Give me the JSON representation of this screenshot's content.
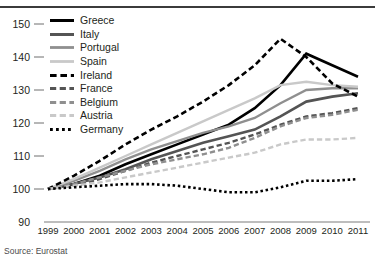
{
  "source_note": "Source: Eurostat",
  "axis": {
    "y_ticks": [
      "150",
      "140",
      "130",
      "120",
      "110",
      "100",
      "90"
    ],
    "x_ticks": [
      "1999",
      "2000",
      "2001",
      "2002",
      "2003",
      "2004",
      "2005",
      "2006",
      "2007",
      "2008",
      "2009",
      "2010",
      "2011"
    ]
  },
  "legend": {
    "items": [
      {
        "label": "Greece",
        "color": "#000000",
        "style": "solid",
        "width": 2.6
      },
      {
        "label": "Italy",
        "color": "#545454",
        "style": "solid",
        "width": 2.6
      },
      {
        "label": "Portugal",
        "color": "#8f8f8f",
        "style": "solid",
        "width": 2.4
      },
      {
        "label": "Spain",
        "color": "#c9c9c9",
        "style": "solid",
        "width": 2.4
      },
      {
        "label": "Ireland",
        "color": "#000000",
        "style": "dashed",
        "width": 2.6
      },
      {
        "label": "France",
        "color": "#545454",
        "style": "dashed",
        "width": 2.4
      },
      {
        "label": "Belgium",
        "color": "#8f8f8f",
        "style": "dashed",
        "width": 2.4
      },
      {
        "label": "Austria",
        "color": "#c9c9c9",
        "style": "dashed",
        "width": 2.4
      },
      {
        "label": "Germany",
        "color": "#000000",
        "style": "dotted",
        "width": 2.6
      }
    ]
  },
  "chart_data": {
    "type": "line",
    "title": "",
    "subtitle": "",
    "xlabel": "",
    "ylabel": "",
    "ylim": [
      90,
      150
    ],
    "xlim": [
      "1999",
      "2011"
    ],
    "grid": false,
    "legend_position": "top-left",
    "annotations": [
      "Source: Eurostat"
    ],
    "x": [
      1999,
      2000,
      2001,
      2002,
      2003,
      2004,
      2005,
      2006,
      2007,
      2008,
      2009,
      2010,
      2011
    ],
    "series": [
      {
        "name": "Greece",
        "color": "#000000",
        "style": "solid",
        "width": 2.6,
        "values": [
          100.0,
          101.5,
          104.0,
          107.5,
          110.5,
          113.5,
          116.5,
          119.5,
          124.5,
          131.5,
          141.0,
          137.5,
          134.0
        ]
      },
      {
        "name": "Italy",
        "color": "#545454",
        "style": "solid",
        "width": 2.6,
        "values": [
          100.0,
          101.5,
          103.5,
          106.0,
          109.0,
          111.5,
          114.0,
          116.0,
          118.0,
          122.0,
          126.5,
          128.0,
          129.0
        ]
      },
      {
        "name": "Portugal",
        "color": "#8f8f8f",
        "style": "solid",
        "width": 2.4,
        "values": [
          100.0,
          102.5,
          105.5,
          109.0,
          112.0,
          114.5,
          117.0,
          119.0,
          121.5,
          126.0,
          130.0,
          130.5,
          130.5
        ]
      },
      {
        "name": "Spain",
        "color": "#c9c9c9",
        "style": "solid",
        "width": 2.4,
        "values": [
          100.0,
          103.0,
          106.5,
          110.0,
          113.5,
          117.0,
          120.5,
          124.0,
          127.5,
          131.5,
          132.5,
          131.5,
          131.0
        ]
      },
      {
        "name": "Ireland",
        "color": "#000000",
        "style": "dashed",
        "width": 2.6,
        "values": [
          100.0,
          104.0,
          108.5,
          113.5,
          118.0,
          122.0,
          126.5,
          131.5,
          137.5,
          145.5,
          140.0,
          132.0,
          128.0
        ]
      },
      {
        "name": "France",
        "color": "#545454",
        "style": "dashed",
        "width": 2.4,
        "values": [
          100.0,
          101.0,
          103.0,
          105.5,
          108.0,
          110.0,
          112.0,
          114.0,
          116.5,
          119.5,
          122.0,
          123.0,
          124.5
        ]
      },
      {
        "name": "Belgium",
        "color": "#8f8f8f",
        "style": "dashed",
        "width": 2.4,
        "values": [
          100.0,
          101.5,
          103.5,
          105.5,
          107.5,
          109.0,
          110.5,
          112.5,
          115.5,
          119.0,
          121.5,
          122.5,
          124.0
        ]
      },
      {
        "name": "Austria",
        "color": "#c9c9c9",
        "style": "dashed",
        "width": 2.4,
        "values": [
          100.0,
          101.0,
          102.0,
          103.5,
          105.0,
          106.5,
          108.0,
          109.5,
          111.0,
          113.5,
          115.0,
          115.0,
          115.5
        ]
      },
      {
        "name": "Germany",
        "color": "#000000",
        "style": "dotted",
        "width": 2.6,
        "values": [
          100.0,
          100.5,
          101.0,
          101.5,
          101.5,
          101.0,
          100.0,
          99.0,
          99.0,
          100.5,
          102.5,
          102.5,
          103.0
        ]
      }
    ]
  }
}
